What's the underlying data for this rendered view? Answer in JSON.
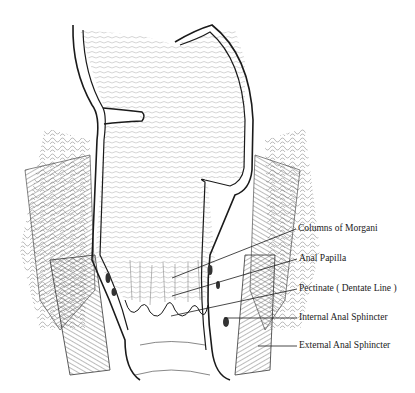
{
  "diagram": {
    "labels": [
      {
        "id": "columns-of-morgani",
        "text": "Columns of Morgani",
        "x": 297,
        "y": 229,
        "target": [
          172,
          278
        ]
      },
      {
        "id": "anal-papilla",
        "text": "Anal Papilla",
        "x": 298,
        "y": 259,
        "target": [
          172,
          296
        ]
      },
      {
        "id": "pectinate-line",
        "text": "Pectinate ( Dentate Line )",
        "x": 298,
        "y": 289,
        "target": [
          171,
          316
        ]
      },
      {
        "id": "internal-anal-sphincter",
        "text": "Internal Anal Sphincter",
        "x": 298,
        "y": 318,
        "target": [
          224,
          318
        ]
      },
      {
        "id": "external-anal-sphincter",
        "text": "External Anal Sphincter",
        "x": 298,
        "y": 346,
        "target": [
          258,
          346
        ]
      }
    ],
    "colors": {
      "ink": "#1a1a1a",
      "background": "#ffffff",
      "hatch": "#555555"
    }
  }
}
